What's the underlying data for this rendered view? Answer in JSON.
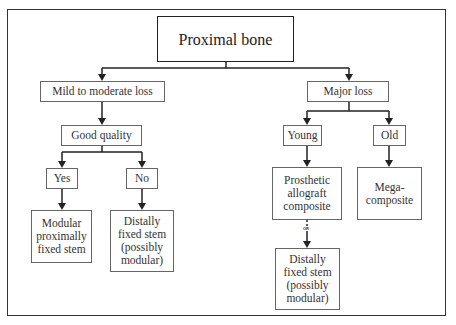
{
  "diagram": {
    "type": "flowchart",
    "root": {
      "label": "Proximal bone"
    },
    "level1": [
      {
        "id": "mild",
        "label": "Mild to moderate loss"
      },
      {
        "id": "major",
        "label": "Major loss"
      }
    ],
    "level2": [
      {
        "id": "good",
        "label": "Good quality",
        "parent": "mild"
      },
      {
        "id": "young",
        "label": "Young",
        "parent": "major"
      },
      {
        "id": "old",
        "label": "Old",
        "parent": "major"
      }
    ],
    "level3": [
      {
        "id": "yes",
        "label": "Yes",
        "parent": "good"
      },
      {
        "id": "no",
        "label": "No",
        "parent": "good"
      }
    ],
    "outcomes": [
      {
        "id": "modular",
        "label": "Modular\nproximally\nfixed stem",
        "parent": "yes"
      },
      {
        "id": "distal_left",
        "label": "Distally\nfixed stem\n(possibly\nmodular)",
        "parent": "no"
      },
      {
        "id": "prosthetic",
        "label": "Prosthetic\nallograft\ncomposite",
        "parent": "young"
      },
      {
        "id": "mega",
        "label": "Mega-\ncomposite",
        "parent": "old"
      },
      {
        "id": "distal_right",
        "label": "Distally\nfixed stem\n(possibly\nmodular)",
        "parent": "prosthetic"
      }
    ],
    "connector_label": "OR",
    "colors": {
      "line": "#222222",
      "box_border": "#666666",
      "text": "#333333"
    }
  }
}
